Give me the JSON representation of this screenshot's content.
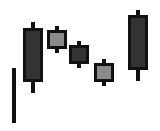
{
  "chart_data": {
    "type": "candlestick",
    "title": "",
    "xlabel": "",
    "ylabel": "",
    "grid": false,
    "legend": null,
    "colors": {
      "outline": "#111111",
      "bearish_fill": "#333333",
      "bullish_fill": "#8a8a8a",
      "background": "#ffffff"
    },
    "annotation_line": {
      "x": 14,
      "y_top": 68,
      "y_bottom": 123,
      "width": 4
    },
    "candles": [
      {
        "index": 1,
        "fill": "dark",
        "body_x": 23,
        "body_w": 20,
        "body_top": 28,
        "body_bottom": 82,
        "wick_top": 22,
        "wick_bottom": 93
      },
      {
        "index": 2,
        "fill": "light",
        "body_x": 47,
        "body_w": 20,
        "body_top": 30,
        "body_bottom": 49,
        "wick_top": 26,
        "wick_bottom": 53
      },
      {
        "index": 3,
        "fill": "dark",
        "body_x": 69,
        "body_w": 20,
        "body_top": 45,
        "body_bottom": 64,
        "wick_top": 41,
        "wick_bottom": 68
      },
      {
        "index": 4,
        "fill": "light",
        "body_x": 94,
        "body_w": 20,
        "body_top": 63,
        "body_bottom": 82,
        "wick_top": 59,
        "wick_bottom": 86
      },
      {
        "index": 5,
        "fill": "dark",
        "body_x": 128,
        "body_w": 20,
        "body_top": 15,
        "body_bottom": 70,
        "wick_top": 10,
        "wick_bottom": 81
      }
    ]
  }
}
